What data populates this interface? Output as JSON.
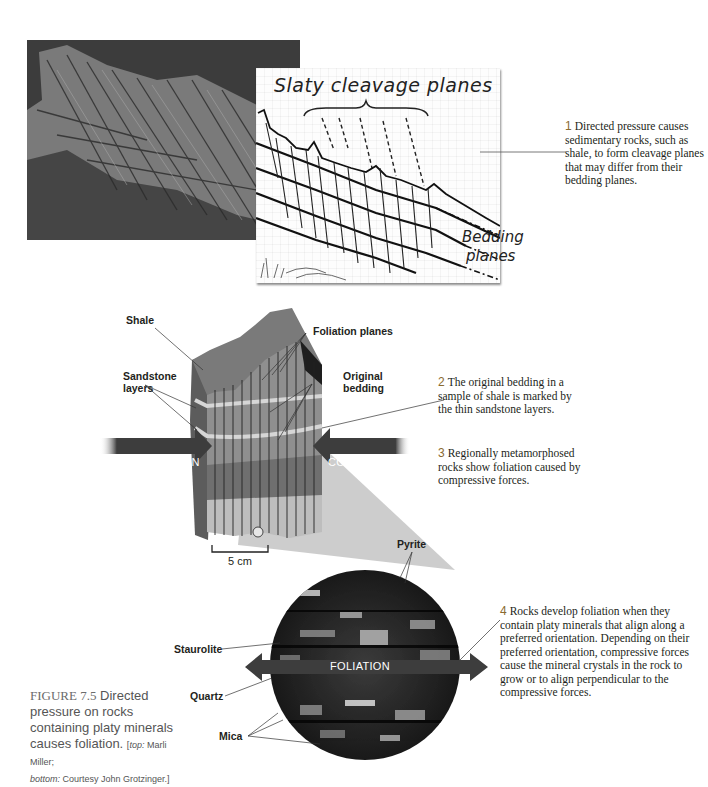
{
  "figure": {
    "number": "FIGURE 7.5",
    "title": "Directed pressure on rocks containing platy minerals causes foliation.",
    "credit_top_label": "top:",
    "credit_top": "Marli Miller;",
    "credit_bottom_label": "bottom:",
    "credit_bottom": "Courtesy John Grotzinger."
  },
  "sketch": {
    "title": "Slaty cleavage planes",
    "bedding_line1": "Bedding",
    "bedding_line2": "planes"
  },
  "callouts": [
    {
      "num": "1",
      "text": "Directed pressure causes sedimentary rocks, such as shale, to form cleavage planes that may differ from their bedding planes."
    },
    {
      "num": "2",
      "text": "The original bedding in a sample of shale is marked by the thin sandstone layers."
    },
    {
      "num": "3",
      "text": "Regionally metamorphosed rocks show foliation caused by compressive forces."
    },
    {
      "num": "4",
      "text": "Rocks develop foliation when they contain platy minerals that align along a preferred orientation. Depending on their preferred orientation, compressive forces cause the mineral crystals in the rock to grow or to align perpendicular to the compressive forces."
    }
  ],
  "block_labels": {
    "shale": "Shale",
    "foliation_planes": "Foliation planes",
    "sandstone_l1": "Sandstone",
    "sandstone_l2": "layers",
    "original_l1": "Original",
    "original_l2": "bedding",
    "scale": "5 cm"
  },
  "arrows": {
    "compression_left": "COMPRESSION",
    "compression_right": "COMPRESSION",
    "foliation": "FOLIATION"
  },
  "mineral_labels": {
    "pyrite": "Pyrite",
    "staurolite": "Staurolite",
    "quartz": "Quartz",
    "mica": "Mica"
  },
  "colors": {
    "callout_number": "#8a6a2f",
    "arrow_fill": "#3d3d3d",
    "text": "#231f20",
    "caption_gray": "#555555"
  }
}
